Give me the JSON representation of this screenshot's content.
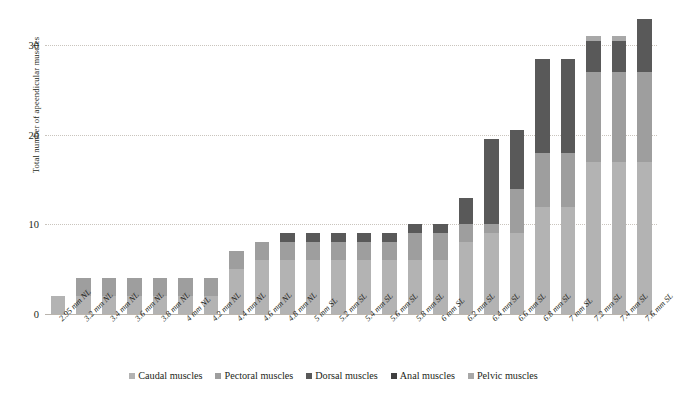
{
  "chart_data": {
    "type": "bar",
    "subtype": "stacked-bar",
    "title": "",
    "xlabel": "",
    "ylabel": "Total number of apeendicular muscles",
    "ylim": [
      0,
      33.5
    ],
    "yticks": [
      0,
      10,
      20,
      30
    ],
    "grid": "horizontal-dotted",
    "legend_position": "bottom-center",
    "categories": [
      "2.95 mm NL",
      "3.2 mm NL",
      "3.4 mm NL",
      "3.6 mm NL",
      "3.8 mm NL",
      "4 mm NL",
      "4.2 mm NL",
      "4.4 mm NL",
      "4.6 mm NL",
      "4.8 mm NL",
      "5 mm SL",
      "5.2 mm SL",
      "5.4 mm SL",
      "5.6 mm SL",
      "5.8 mm SL",
      "6 mm SL",
      "6.2 mm SL",
      "6.4 mm SL",
      "6.6 mm SL",
      "6.8 mm SL",
      "7 mm SL",
      "7.2 mm SL",
      "7.4 mm SL",
      "7.6 mm SL"
    ],
    "series": [
      {
        "name": "Caudal muscles",
        "color": "#b3b3b3",
        "values": [
          2,
          2,
          2,
          2,
          2,
          2,
          2,
          5,
          6,
          6,
          6,
          6,
          6,
          6,
          6,
          6,
          8,
          9,
          9,
          12,
          12,
          17,
          17,
          17
        ]
      },
      {
        "name": "Pectoral muscles",
        "color": "#9e9e9e",
        "values": [
          0,
          2,
          2,
          2,
          2,
          2,
          2,
          2,
          2,
          2,
          2,
          2,
          2,
          2,
          3,
          3,
          2,
          1,
          5,
          6,
          6,
          10,
          10,
          10
        ]
      },
      {
        "name": "Dorsal muscles",
        "color": "#595959",
        "values": [
          0,
          0,
          0,
          0,
          0,
          0,
          0,
          0,
          0,
          1,
          1,
          1,
          1,
          1,
          1,
          1,
          3,
          9.5,
          6.5,
          10.5,
          10.5,
          3.5,
          3.5,
          6
        ]
      },
      {
        "name": "Anal muscles",
        "color": "#404040",
        "values": [
          0,
          0,
          0,
          0,
          0,
          0,
          0,
          0,
          0,
          0,
          0,
          0,
          0,
          0,
          0,
          0,
          0,
          0,
          0,
          0,
          0,
          0,
          0,
          0
        ]
      },
      {
        "name": "Pelvic muscles",
        "color": "#a8a8a8",
        "values": [
          0,
          0,
          0,
          0,
          0,
          0,
          0,
          0,
          0,
          0,
          0,
          0,
          0,
          0,
          0,
          0,
          0,
          0,
          0,
          0,
          0,
          0.5,
          0.5,
          0
        ]
      }
    ],
    "totals": [
      2,
      4,
      4,
      4,
      4,
      4,
      4,
      7,
      8,
      9,
      9,
      9,
      9,
      9,
      10,
      10,
      13,
      19.5,
      20.5,
      28.5,
      28.5,
      31,
      31,
      33
    ]
  },
  "legend": {
    "items": [
      {
        "label": "Caudal muscles",
        "color": "#b3b3b3"
      },
      {
        "label": "Pectoral muscles",
        "color": "#9e9e9e"
      },
      {
        "label": "Dorsal muscles",
        "color": "#595959"
      },
      {
        "label": "Anal muscles",
        "color": "#404040"
      },
      {
        "label": "Pelvic muscles",
        "color": "#a8a8a8"
      }
    ]
  }
}
